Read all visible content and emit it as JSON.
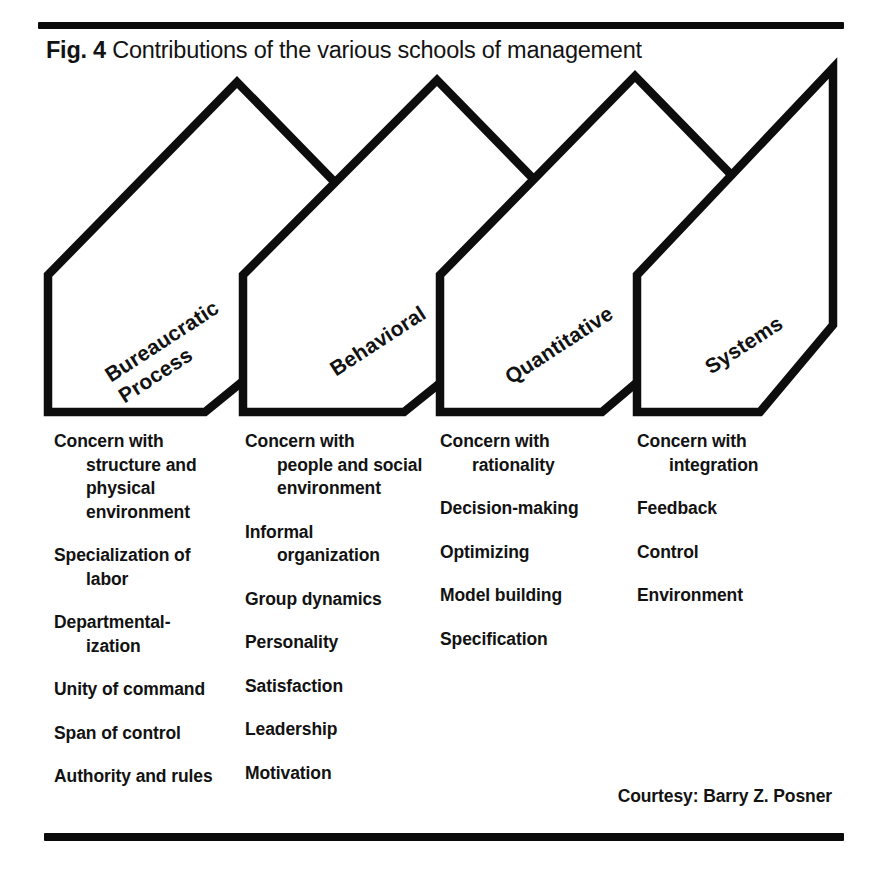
{
  "figure": {
    "label": "Fig. 4",
    "caption": "Contributions of the various schools of management",
    "courtesy": "Courtesy: Barry Z. Posner",
    "ink_color": "#0d0d0d",
    "background_color": "#ffffff"
  },
  "schools": [
    {
      "id": "bureaucratic-process",
      "name_line_1": "Bureaucratic",
      "name_line_2": "Process",
      "contributions": [
        {
          "head": "Concern with",
          "cont": "structure and physical environment"
        },
        {
          "head": "Specialization of",
          "cont": "labor"
        },
        {
          "head": "Departmental-",
          "cont": "ization"
        },
        {
          "head": "Unity of command",
          "cont": ""
        },
        {
          "head": "Span of control",
          "cont": ""
        },
        {
          "head": "Authority and rules",
          "cont": ""
        }
      ]
    },
    {
      "id": "behavioral",
      "name_line_1": "Behavioral",
      "name_line_2": "",
      "contributions": [
        {
          "head": "Concern with",
          "cont": "people and social environment"
        },
        {
          "head": "Informal",
          "cont": "organization"
        },
        {
          "head": "Group dynamics",
          "cont": ""
        },
        {
          "head": "Personality",
          "cont": ""
        },
        {
          "head": "Satisfaction",
          "cont": ""
        },
        {
          "head": "Leadership",
          "cont": ""
        },
        {
          "head": "Motivation",
          "cont": ""
        }
      ]
    },
    {
      "id": "quantitative",
      "name_line_1": "Quantitative",
      "name_line_2": "",
      "contributions": [
        {
          "head": "Concern with",
          "cont": "rationality"
        },
        {
          "head": "Decision-making",
          "cont": ""
        },
        {
          "head": "Optimizing",
          "cont": ""
        },
        {
          "head": "Model building",
          "cont": ""
        },
        {
          "head": "Specification",
          "cont": ""
        }
      ]
    },
    {
      "id": "systems",
      "name_line_1": "Systems",
      "name_line_2": "",
      "contributions": [
        {
          "head": "Concern with",
          "cont": "integration"
        },
        {
          "head": "Feedback",
          "cont": ""
        },
        {
          "head": "Control",
          "cont": ""
        },
        {
          "head": "Environment",
          "cont": ""
        }
      ]
    }
  ],
  "column_text": {
    "col0": [
      "Concern with",
      "structure and",
      "physical",
      "environment",
      "Specialization of",
      "labor",
      "Departmental-",
      "ization",
      "Unity of command",
      "Span of control",
      "Authority and rules"
    ],
    "col1": [
      "Concern with",
      "people and",
      "social",
      "environment",
      "Informal",
      "organization",
      "Group dynamics",
      "Personality",
      "Satisfaction",
      "Leadership",
      "Motivation"
    ],
    "col2": [
      "Concern with",
      "rationality",
      "Decision-making",
      "Optimizing",
      "Model building",
      "Specification"
    ],
    "col3": [
      "Concern with",
      "integration",
      "Feedback",
      "Control",
      "Environment"
    ]
  }
}
